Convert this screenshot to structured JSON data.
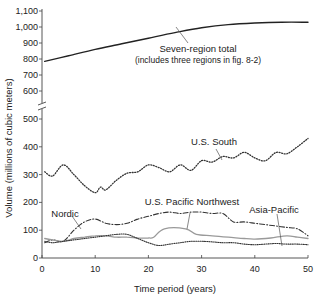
{
  "chart_data": {
    "type": "line",
    "title": "",
    "xlabel": "Time period (years)",
    "ylabel": "Volume (millions of cubic meters)",
    "xlim": [
      0,
      50
    ],
    "x_ticks": [
      0,
      10,
      20,
      30,
      40,
      50
    ],
    "y_ticks_lower": [
      0,
      100,
      200,
      300,
      400,
      500
    ],
    "y_ticks_upper": [
      600,
      700,
      800,
      900,
      1000,
      1100
    ],
    "y_tick_labels_lower": [
      "0",
      "100",
      "200",
      "300",
      "400",
      "500"
    ],
    "y_tick_labels_upper": [
      "600",
      "700",
      "800",
      "900",
      "1,000",
      "1,100"
    ],
    "axis_break": "between 500 and 600",
    "grid": false,
    "legend": "inline annotations",
    "series": [
      {
        "name": "Seven-region total",
        "annotation": "Seven-region total",
        "annotation_sub": "(includes three regions in fig. 8-2)",
        "style": "solid",
        "x": [
          0.5,
          5,
          10,
          15,
          20,
          25,
          30,
          35,
          40,
          45,
          50
        ],
        "values": [
          785,
          820,
          860,
          895,
          930,
          965,
          995,
          1015,
          1025,
          1030,
          1030
        ]
      },
      {
        "name": "U.S. South",
        "annotation": "U.S. South",
        "style": "dotted",
        "x": [
          0.5,
          2,
          4,
          6,
          8,
          10,
          11,
          12,
          14,
          16,
          18,
          20,
          22,
          24,
          26,
          28,
          30,
          32,
          34,
          36,
          38,
          40,
          42,
          44,
          46,
          48,
          50
        ],
        "values": [
          310,
          295,
          335,
          300,
          260,
          235,
          255,
          245,
          280,
          305,
          310,
          335,
          325,
          310,
          335,
          315,
          350,
          345,
          365,
          360,
          380,
          360,
          350,
          380,
          375,
          400,
          430
        ]
      },
      {
        "name": "Nordic",
        "annotation": "Nordic",
        "style": "dash-dot",
        "x": [
          0.5,
          2,
          4,
          6,
          8,
          10,
          12,
          14,
          16,
          18,
          20,
          22,
          24,
          26,
          28,
          30,
          32,
          34,
          36,
          38,
          40,
          42,
          44,
          46,
          48,
          50
        ],
        "values": [
          55,
          65,
          60,
          100,
          130,
          140,
          125,
          120,
          125,
          140,
          150,
          160,
          165,
          160,
          165,
          165,
          160,
          160,
          130,
          130,
          125,
          120,
          115,
          110,
          105,
          80
        ]
      },
      {
        "name": "U.S. Pacific Northwest",
        "annotation": "U.S. Pacific Northwest",
        "style": "solid-gray",
        "x": [
          0.5,
          2,
          4,
          6,
          8,
          10,
          12,
          14,
          16,
          18,
          20,
          21,
          23,
          27,
          29,
          32,
          35,
          38,
          40,
          43,
          46,
          48,
          50
        ],
        "values": [
          70,
          65,
          60,
          70,
          75,
          80,
          80,
          75,
          75,
          72,
          72,
          75,
          105,
          105,
          85,
          80,
          75,
          70,
          68,
          72,
          80,
          75,
          70
        ]
      },
      {
        "name": "Asia-Pacific",
        "annotation": "Asia-Pacific",
        "style": "dotted-dense",
        "x": [
          0.5,
          2,
          4,
          6,
          8,
          10,
          12,
          14,
          16,
          18,
          20,
          22,
          24,
          26,
          28,
          30,
          32,
          34,
          36,
          38,
          40,
          42,
          44,
          46,
          48,
          50
        ],
        "values": [
          60,
          55,
          60,
          65,
          70,
          75,
          80,
          85,
          85,
          70,
          55,
          45,
          50,
          55,
          60,
          60,
          58,
          55,
          55,
          50,
          48,
          50,
          52,
          50,
          50,
          48
        ]
      }
    ]
  },
  "labels": {
    "xlabel": "Time period (years)",
    "ylabel": "Volume (millions of cubic meters)",
    "total_title": "Seven-region total",
    "total_sub": "(includes three regions in fig. 8-2)",
    "us_south": "U.S. South",
    "nordic": "Nordic",
    "us_pnw": "U.S. Pacific Northwest",
    "asia_pacific": "Asia-Pacific"
  }
}
